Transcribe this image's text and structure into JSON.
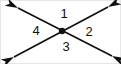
{
  "figure": {
    "type": "geometry-diagram",
    "background_color": "#ffffff",
    "stroke_color": "#101010",
    "border_color": "#e6e6e6",
    "width": 121,
    "height": 64,
    "vertex": {
      "name": "intersection-point",
      "x": 62,
      "y": 31,
      "radius": 3.2,
      "filled": true
    },
    "lines": [
      {
        "name": "line-nw-se",
        "description": "double-headed arrow from upper-left to lower-right",
        "x1": 18,
        "y1": 8,
        "x2": 112,
        "y2": 56,
        "arrow_start": true,
        "arrow_end": true
      },
      {
        "name": "line-sw-ne",
        "description": "double-headed arrow from lower-left to upper-right",
        "x1": 14,
        "y1": 57,
        "x2": 108,
        "y2": 7,
        "arrow_start": true,
        "arrow_end": true
      }
    ],
    "arrowheads": [
      {
        "name": "arrowhead-upper-left",
        "x": 18,
        "y": 8,
        "angle": 207
      },
      {
        "name": "arrowhead-lower-right",
        "x": 112,
        "y": 56,
        "angle": 27
      },
      {
        "name": "arrowhead-lower-left",
        "x": 14,
        "y": 57,
        "angle": 152
      },
      {
        "name": "arrowhead-upper-right",
        "x": 108,
        "y": 7,
        "angle": 332
      }
    ],
    "labels": [
      {
        "name": "angle-label-1",
        "text": "1",
        "x": 64,
        "y": 15,
        "position": "top"
      },
      {
        "name": "angle-label-2",
        "text": "2",
        "x": 89,
        "y": 33,
        "position": "right"
      },
      {
        "name": "angle-label-3",
        "text": "3",
        "x": 66,
        "y": 48,
        "position": "bottom"
      },
      {
        "name": "angle-label-4",
        "text": "4",
        "x": 36,
        "y": 32,
        "position": "left"
      }
    ]
  }
}
